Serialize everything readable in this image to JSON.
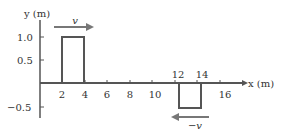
{
  "diagram": {
    "type": "wave-pulse-diagram",
    "y_axis": {
      "label": "y (m)",
      "ticks": [
        "1.0",
        "0.5",
        "−0.5"
      ]
    },
    "x_axis": {
      "label": "x (m)",
      "ticks_below": [
        "2",
        "4",
        "6",
        "8",
        "10",
        "16"
      ],
      "ticks_above": [
        "12",
        "14"
      ]
    },
    "pulses": [
      {
        "name": "positive-pulse",
        "x_start": 2,
        "x_end": 4,
        "height": 1.0,
        "velocity_label": "v",
        "direction": "right"
      },
      {
        "name": "negative-pulse",
        "x_start": 12,
        "x_end": 14,
        "height": -0.5,
        "velocity_label": "−v",
        "direction": "left"
      }
    ],
    "colors": {
      "axis": "#555555",
      "pulse": "#555555",
      "arrow": "#777777",
      "text": "#333333"
    }
  }
}
